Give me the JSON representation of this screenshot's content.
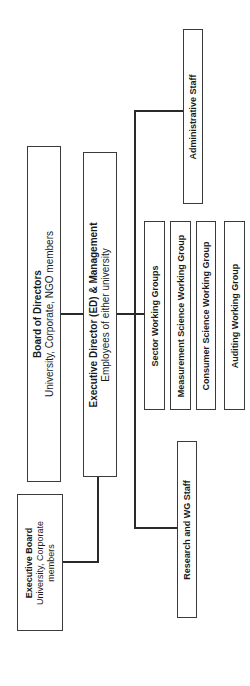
{
  "diagram": {
    "type": "org-chart",
    "orientation": "rotated-90-ccw",
    "nodes": {
      "board": {
        "title": "Board of Directors",
        "subtitle": "University, Corporate, NGO members"
      },
      "ed": {
        "title": "Executive Director (ED) & Management",
        "subtitle": "Employees of either university"
      },
      "exec_board": {
        "title": "Executive Board",
        "subtitle1": "University, Corporate",
        "subtitle2": "members"
      },
      "admin": {
        "title": "Administrative Staff"
      },
      "research": {
        "title": "Research and WG Staff"
      },
      "wg": [
        {
          "title": "Sector Working Groups"
        },
        {
          "title": "Measurement Science Working Group"
        },
        {
          "title": "Consumer Science Working Group"
        },
        {
          "title": "Auditing Working Group"
        }
      ]
    },
    "line_color": "#2a2a2a",
    "border_color": "#3a3a3a"
  }
}
